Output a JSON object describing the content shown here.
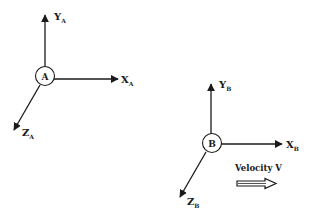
{
  "diagram": {
    "type": "coordinate-frames",
    "colors": {
      "ink": "#1a1a1a",
      "background": "#ffffff"
    },
    "frames": [
      {
        "id": "A",
        "node_label": "A",
        "axes": {
          "y": {
            "main": "Y",
            "sub": "A"
          },
          "x": {
            "main": "X",
            "sub": "A"
          },
          "z": {
            "main": "Z",
            "sub": "A"
          }
        }
      },
      {
        "id": "B",
        "node_label": "B",
        "axes": {
          "y": {
            "main": "Y",
            "sub": "B"
          },
          "x": {
            "main": "X",
            "sub": "B"
          },
          "z": {
            "main": "Z",
            "sub": "B"
          }
        }
      }
    ],
    "velocity": {
      "label": "Velocity V",
      "direction": "right"
    }
  }
}
